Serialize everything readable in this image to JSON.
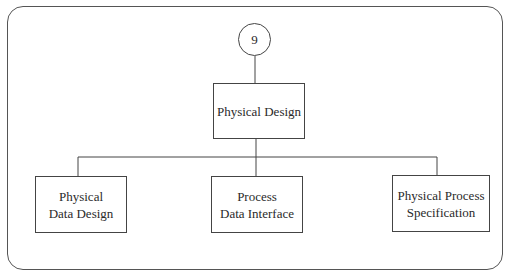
{
  "diagram": {
    "type": "hierarchy",
    "root_marker": {
      "label": "9"
    },
    "root": {
      "label": "Physical Design"
    },
    "children": [
      {
        "label": "Physical\nData Design"
      },
      {
        "label": "Process\nData Interface"
      },
      {
        "label": "Physical Process\nSpecification"
      }
    ],
    "colors": {
      "line": "#444444",
      "text": "#2a2a2a",
      "background": "#ffffff"
    }
  }
}
